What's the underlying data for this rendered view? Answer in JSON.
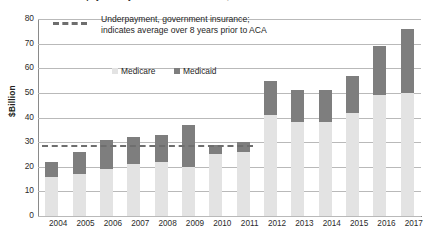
{
  "chart_data": {
    "type": "bar",
    "stacked": true,
    "title": "Underpayment by Medicare and Medicaid, 2004-2017",
    "xlabel": "",
    "ylabel": "$Billion",
    "ylim": [
      0,
      80
    ],
    "ytick_step": 10,
    "yticks": [
      "80",
      "70",
      "60",
      "50",
      "40",
      "30",
      "20",
      "10",
      "0"
    ],
    "grid": true,
    "legend_position": "top-center",
    "categories": [
      "2004",
      "2005",
      "2006",
      "2007",
      "2008",
      "2009",
      "2010",
      "2011",
      "2012",
      "2013",
      "2014",
      "2015",
      "2016",
      "2017"
    ],
    "series": [
      {
        "name": "Medicare",
        "color": "#e3e3e3",
        "values": [
          16,
          17,
          19,
          21,
          22,
          20,
          25,
          26,
          41,
          38,
          38,
          42,
          49,
          50
        ]
      },
      {
        "name": "Medicaid",
        "color": "#7e7e7e",
        "values": [
          6,
          9,
          12,
          11,
          11,
          17,
          4,
          4,
          14,
          13,
          13,
          15,
          20,
          26
        ]
      }
    ],
    "totals": [
      22,
      26,
      31,
      32,
      33,
      37,
      29,
      30,
      55,
      51,
      51,
      57,
      69,
      76
    ],
    "annotations": [
      {
        "name": "pre-aca-average-line",
        "type": "dashed-hline",
        "value": 29,
        "span_categories": [
          "2004",
          "2011"
        ],
        "color": "#6e6e6e"
      }
    ]
  },
  "legend": {
    "average_note_line1": "Underpayment, government insurance;",
    "average_note_line2": "indicates average over 8 years prior to ACA",
    "series_labels": [
      "Medicare",
      "Medicaid"
    ]
  }
}
